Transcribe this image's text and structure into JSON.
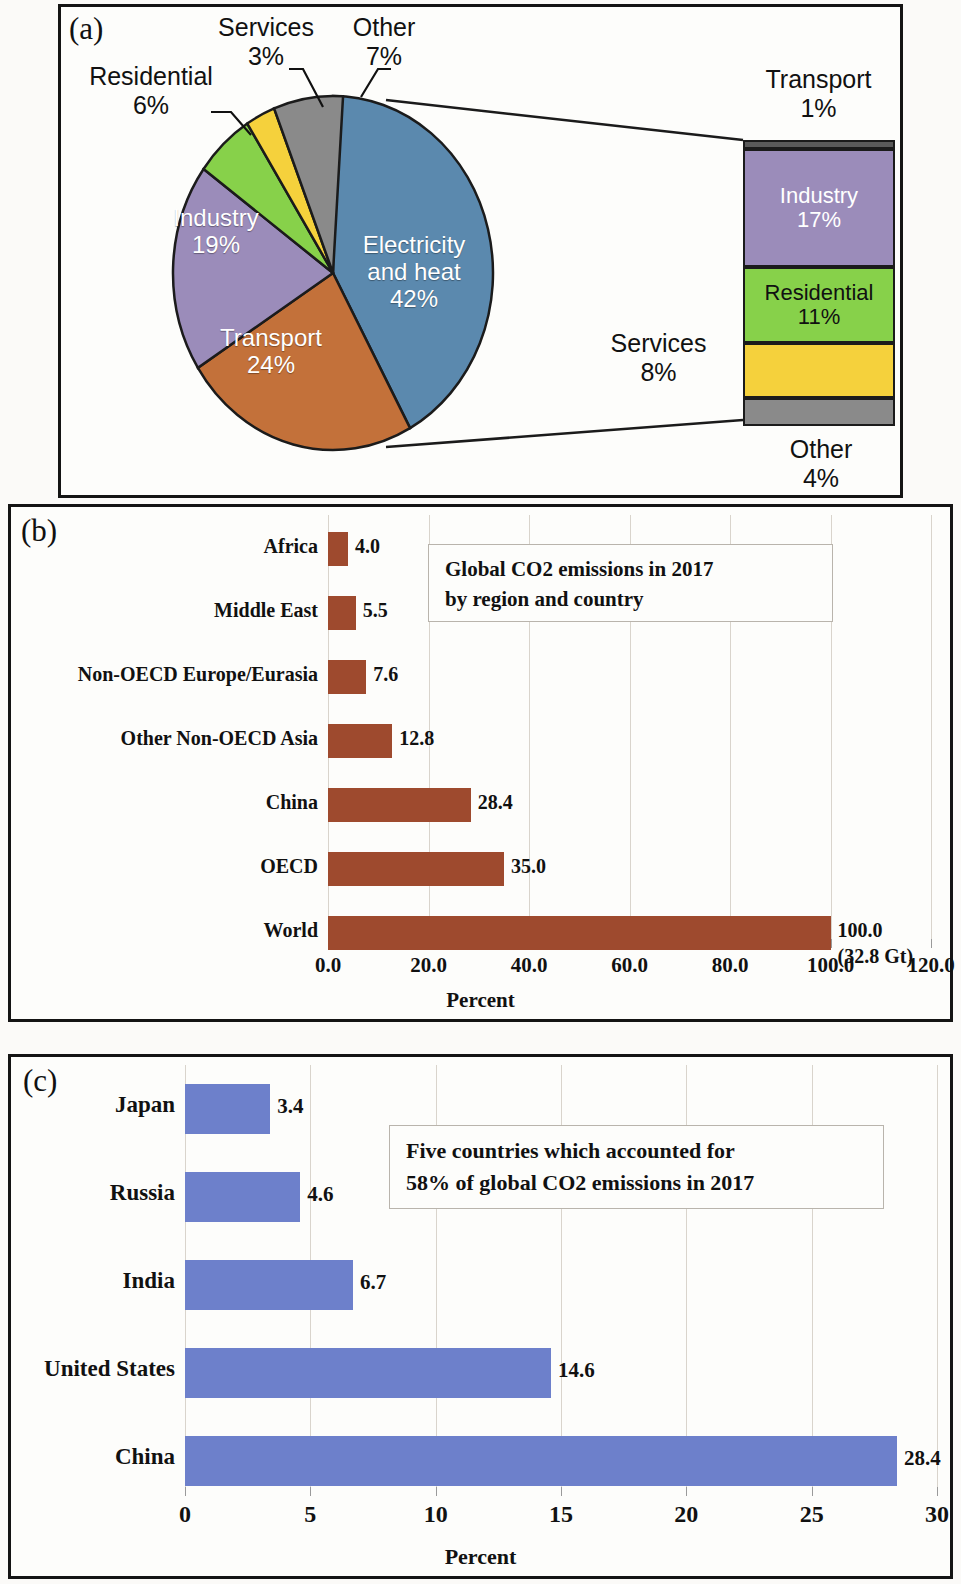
{
  "figure": {
    "panel_a_label": "(a)",
    "panel_b_label": "(b)",
    "panel_c_label": "(c)"
  },
  "colors": {
    "electricity": "#5b89ae",
    "transport": "#c3713a",
    "industry": "#9b8cba",
    "residential": "#87d14a",
    "services": "#f5d13c",
    "other": "#8a8a8a",
    "bar_brown": "#9e4a2e",
    "bar_blue": "#6d80cb",
    "outline": "#1b1b1b"
  },
  "chart_data": [
    {
      "type": "pie",
      "title": "",
      "panel": "(a)",
      "categories": [
        "Electricity and heat",
        "Transport",
        "Industry",
        "Residential",
        "Services",
        "Other"
      ],
      "values": [
        42,
        24,
        19,
        6,
        3,
        7
      ],
      "labels": [
        {
          "name": "Electricity\nand heat",
          "line1": "Electricity",
          "line2": "and heat",
          "pct": "42%",
          "inside": true
        },
        {
          "name": "Transport",
          "line1": "Transport",
          "line2": "",
          "pct": "24%",
          "inside": true
        },
        {
          "name": "Industry",
          "line1": "Industry",
          "line2": "",
          "pct": "19%",
          "inside": true
        },
        {
          "name": "Residential",
          "line1": "Residential",
          "line2": "",
          "pct": "6%",
          "inside": false
        },
        {
          "name": "Services",
          "line1": "Services",
          "line2": "",
          "pct": "3%",
          "inside": false
        },
        {
          "name": "Other",
          "line1": "Other",
          "line2": "",
          "pct": "7%",
          "inside": false
        }
      ],
      "units": "percent",
      "legend": "none"
    },
    {
      "type": "bar",
      "orientation": "stacked-vertical",
      "panel": "(a)",
      "note": "breakout of Electricity and heat slice",
      "categories": [
        "Transport",
        "Industry",
        "Residential",
        "Services",
        "Other"
      ],
      "values": [
        1,
        17,
        11,
        8,
        4
      ],
      "labels_inside": [
        "",
        "Industry\n17%",
        "Residential\n11%",
        "",
        ""
      ],
      "labels_outside": [
        "Transport\n1%",
        "",
        "",
        "Services\n8%",
        "Other\n4%"
      ]
    },
    {
      "type": "bar",
      "orientation": "horizontal",
      "panel": "(b)",
      "title": "Global CO2 emissions in 2017 by region and country",
      "categories": [
        "Africa",
        "Middle East",
        "Non-OECD Europe/Eurasia",
        "Other Non-OECD Asia",
        "China",
        "OECD",
        "World"
      ],
      "values": [
        4.0,
        5.5,
        7.6,
        12.8,
        28.4,
        35.0,
        100.0
      ],
      "value_labels": [
        "4.0",
        "5.5",
        "7.6",
        "12.8",
        "28.4",
        "35.0",
        "100.0"
      ],
      "extra_label": "(32.8 Gt)",
      "xlabel": "Percent",
      "ylabel": "",
      "xlim": [
        0,
        120
      ],
      "xticks": [
        0,
        20,
        40,
        60,
        80,
        100,
        120
      ],
      "xticklabels": [
        "0.0",
        "20.0",
        "40.0",
        "60.0",
        "80.0",
        "100.0",
        "120.0"
      ],
      "grid": true,
      "color": "#9e4a2e"
    },
    {
      "type": "bar",
      "orientation": "horizontal",
      "panel": "(c)",
      "title": "Five countries which accounted for 58% of global CO2 emissions in 2017",
      "categories": [
        "Japan",
        "Russia",
        "India",
        "United States",
        "China"
      ],
      "values": [
        3.4,
        4.6,
        6.7,
        14.6,
        28.4
      ],
      "value_labels": [
        "3.4",
        "4.6",
        "6.7",
        "14.6",
        "28.4"
      ],
      "xlabel": "Percent",
      "ylabel": "",
      "xlim": [
        0,
        30
      ],
      "xticks": [
        0,
        5,
        10,
        15,
        20,
        25,
        30
      ],
      "xticklabels": [
        "0",
        "5",
        "10",
        "15",
        "20",
        "25",
        "30"
      ],
      "grid": true,
      "color": "#6d80cb"
    }
  ],
  "panel_a": {
    "pie": {
      "electricity_l1": "Electricity",
      "electricity_l2": "and heat",
      "electricity_pct": "42%",
      "transport_name": "Transport",
      "transport_pct": "24%",
      "industry_name": "Industry",
      "industry_pct": "19%",
      "residential_name": "Residential",
      "residential_pct": "6%",
      "services_name": "Services",
      "services_pct": "3%",
      "other_name": "Other",
      "other_pct": "7%"
    },
    "stack": {
      "transport_name": "Transport",
      "transport_pct": "1%",
      "industry_name": "Industry",
      "industry_pct": "17%",
      "residential_name": "Residential",
      "residential_pct": "11%",
      "services_name": "Services",
      "services_pct": "8%",
      "other_name": "Other",
      "other_pct": "4%"
    }
  },
  "panel_b": {
    "note_line1": "Global CO2 emissions in 2017",
    "note_line2": "by region and country",
    "axis_title": "Percent",
    "rows": [
      {
        "label": "Africa",
        "value": 4.0,
        "value_label": "4.0"
      },
      {
        "label": "Middle East",
        "value": 5.5,
        "value_label": "5.5"
      },
      {
        "label": "Non-OECD Europe/Eurasia",
        "value": 7.6,
        "value_label": "7.6"
      },
      {
        "label": "Other Non-OECD Asia",
        "value": 12.8,
        "value_label": "12.8"
      },
      {
        "label": "China",
        "value": 28.4,
        "value_label": "28.4"
      },
      {
        "label": "OECD",
        "value": 35.0,
        "value_label": "35.0"
      },
      {
        "label": "World",
        "value": 100.0,
        "value_label": "100.0",
        "sub_label": "(32.8 Gt)"
      }
    ],
    "ticks": [
      "0.0",
      "20.0",
      "40.0",
      "60.0",
      "80.0",
      "100.0",
      "120.0"
    ]
  },
  "panel_c": {
    "note_line1": "Five countries which accounted for",
    "note_line2": "58% of global CO2 emissions in 2017",
    "axis_title": "Percent",
    "rows": [
      {
        "label": "Japan",
        "value": 3.4,
        "value_label": "3.4"
      },
      {
        "label": "Russia",
        "value": 4.6,
        "value_label": "4.6"
      },
      {
        "label": "India",
        "value": 6.7,
        "value_label": "6.7"
      },
      {
        "label": "United States",
        "value": 14.6,
        "value_label": "14.6"
      },
      {
        "label": "China",
        "value": 28.4,
        "value_label": "28.4"
      }
    ],
    "ticks": [
      "0",
      "5",
      "10",
      "15",
      "20",
      "25",
      "30"
    ]
  }
}
